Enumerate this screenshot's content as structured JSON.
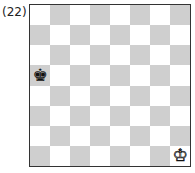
{
  "diagram": {
    "label": "(22)",
    "board": {
      "files": [
        "a",
        "b",
        "c",
        "d",
        "e",
        "f",
        "g",
        "h"
      ],
      "ranks": [
        8,
        7,
        6,
        5,
        4,
        3,
        2,
        1
      ],
      "top_left_square_color": "light",
      "colors": {
        "light": "#ffffff",
        "dark": "#cfcfcf"
      }
    },
    "pieces": [
      {
        "square": "a5",
        "piece": "king",
        "color": "black",
        "glyph": "♚"
      },
      {
        "square": "h1",
        "piece": "king",
        "color": "white",
        "glyph": "♔"
      }
    ]
  }
}
